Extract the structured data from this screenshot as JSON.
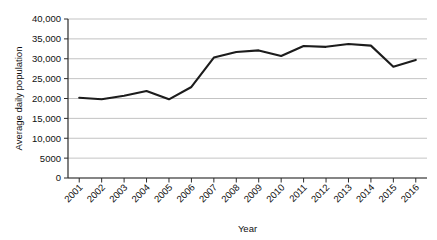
{
  "chart_data": {
    "type": "line",
    "title": "",
    "xlabel": "Year",
    "ylabel": "Average daily population",
    "categories": [
      "2001",
      "2002",
      "2003",
      "2004",
      "2005",
      "2006",
      "2007",
      "2008",
      "2009",
      "2010",
      "2011",
      "2012",
      "2013",
      "2014",
      "2015",
      "2016"
    ],
    "values": [
      20200,
      19800,
      20700,
      21900,
      19800,
      22900,
      30300,
      31700,
      32100,
      30700,
      33200,
      33000,
      33700,
      33300,
      28000,
      29700
    ],
    "series": [
      {
        "name": "Average daily population",
        "values": [
          20200,
          19800,
          20700,
          21900,
          19800,
          22900,
          30300,
          31700,
          32100,
          30700,
          33200,
          33000,
          33700,
          33300,
          28000,
          29700
        ]
      }
    ],
    "ylim": [
      0,
      40000
    ],
    "ytick_values": [
      0,
      5000,
      10000,
      15000,
      20000,
      25000,
      30000,
      35000,
      40000
    ],
    "ytick_labels": [
      "0",
      "5000",
      "10,000",
      "15,000",
      "20,000",
      "25,000",
      "30,000",
      "35,000",
      "40,000"
    ],
    "xtick_labels": [
      "2001",
      "2002",
      "2003",
      "2004",
      "2005",
      "2006",
      "2007",
      "2008",
      "2009",
      "2010",
      "2011",
      "2012",
      "2013",
      "2014",
      "2015",
      "2016"
    ],
    "xtick_rotation_degrees": 45,
    "grid": "horizontal",
    "legend": "none",
    "line_color": "#1c1c1c",
    "gridline_color": "#a9a9a9",
    "axis_color": "#2b2b2b",
    "background_color": "#ffffff"
  }
}
